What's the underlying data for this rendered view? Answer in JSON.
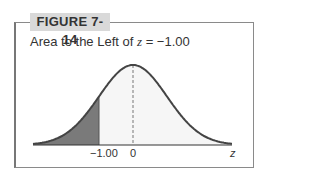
{
  "figure_label": "FIGURE 7-14",
  "title_prefix": "Area to the Left of ",
  "title_var": "z",
  "title_suffix": " = −1.00",
  "tick_neg": "−1.00",
  "tick_zero": "0",
  "axis_label": "z",
  "colors": {
    "shade": "#7a7a7a",
    "curve_fill": "#f6f6f6",
    "curve": "#444444"
  },
  "chart_data": {
    "type": "area",
    "xlabel": "z",
    "ylabel": "",
    "distribution": "standard normal",
    "tick_labels": [
      "-1.00",
      "0"
    ],
    "shaded_region": {
      "from": "-inf",
      "to": -1.0
    },
    "mean_line": 0,
    "xlim": [
      -3.5,
      3.5
    ]
  }
}
